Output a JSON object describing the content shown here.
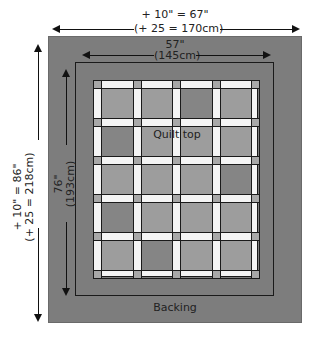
{
  "diagram": {
    "top_dimension": {
      "line1": "+ 10\" = 67\"",
      "line2": "(+ 25 = 170cm)"
    },
    "inner_width": {
      "line1": "57\"",
      "line2": "(145cm)"
    },
    "left_dimension": {
      "line1": "+ 10\" = 86\"",
      "line2": "(+ 25 = 218cm)"
    },
    "inner_height": {
      "line1": "76\"",
      "line2": "(193cm)"
    },
    "quilt_label": "Quilt top",
    "backing_label": "Backing",
    "grid": {
      "rows": 5,
      "cols": 4,
      "dark_blocks": [
        [
          0,
          2
        ],
        [
          1,
          0
        ],
        [
          2,
          3
        ],
        [
          3,
          0
        ],
        [
          4,
          1
        ]
      ]
    },
    "colors": {
      "backing": "#7d7d7d",
      "block": "#9d9d9d",
      "block_dark": "#858585",
      "sashing": "#f4f4f4",
      "cornerstone": "#a8a8a8"
    }
  }
}
